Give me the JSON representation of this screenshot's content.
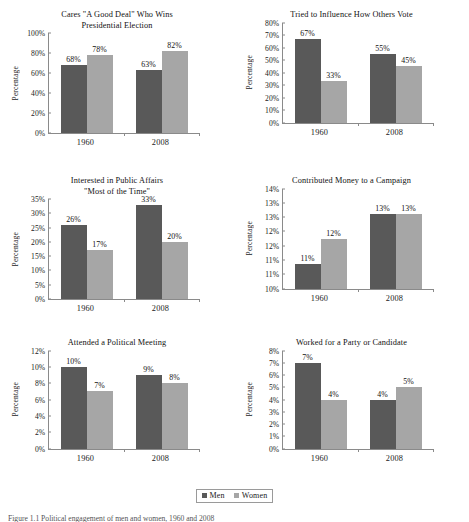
{
  "colors": {
    "men": "#595959",
    "women": "#a6a6a6",
    "axis": "#8a8a8a",
    "text": "#111111"
  },
  "legend": {
    "men_label": "Men",
    "women_label": "Women"
  },
  "caption": "Figure 1.1 Political engagement of men and women, 1960 and 2008",
  "series_names": [
    "Men",
    "Women"
  ],
  "categories": [
    "1960",
    "2008"
  ],
  "y_axis_title": "Percentage",
  "chart_data": [
    {
      "id": "cares-good-deal",
      "type": "bar",
      "title": "Cares \"A Good Deal\" Who Wins",
      "title_line2": "Presidential Election",
      "xlabel": "",
      "ylabel": "Percentage",
      "categories": [
        "1960",
        "2008"
      ],
      "series": [
        {
          "name": "Men",
          "values": [
            68,
            78
          ]
        },
        {
          "name": "Women",
          "values": [
            78,
            82
          ]
        }
      ],
      "bars": [
        {
          "category": "1960",
          "series": "Men",
          "value": 68,
          "label": "68%"
        },
        {
          "category": "1960",
          "series": "Women",
          "value": 78,
          "label": "78%"
        },
        {
          "category": "2008",
          "series": "Men",
          "value": 63,
          "label": "63%"
        },
        {
          "category": "2008",
          "series": "Women",
          "value": 82,
          "label": "82%"
        }
      ],
      "ylim": [
        0,
        100
      ],
      "yticks": [
        0,
        20,
        40,
        60,
        80,
        100
      ],
      "ytick_labels": [
        "0%",
        "20%",
        "40%",
        "60%",
        "80%",
        "100%"
      ],
      "grid": false
    },
    {
      "id": "influence-others-vote",
      "type": "bar",
      "title": "Tried to Influence How Others Vote",
      "title_line2": "",
      "xlabel": "",
      "ylabel": "Percentage",
      "categories": [
        "1960",
        "2008"
      ],
      "bars": [
        {
          "category": "1960",
          "series": "Men",
          "value": 67,
          "label": "67%"
        },
        {
          "category": "1960",
          "series": "Women",
          "value": 33,
          "label": "33%"
        },
        {
          "category": "2008",
          "series": "Men",
          "value": 55,
          "label": "55%"
        },
        {
          "category": "2008",
          "series": "Women",
          "value": 45,
          "label": "45%"
        }
      ],
      "ylim": [
        0,
        80
      ],
      "yticks": [
        0,
        10,
        20,
        30,
        40,
        50,
        60,
        70,
        80
      ],
      "ytick_labels": [
        "0%",
        "10%",
        "20%",
        "30%",
        "40%",
        "50%",
        "60%",
        "70%",
        "80%"
      ],
      "grid": false
    },
    {
      "id": "interested-public-affairs",
      "type": "bar",
      "title": "Interested in Public Affairs",
      "title_line2": "\"Most of the Time\"",
      "xlabel": "",
      "ylabel": "Percentage",
      "categories": [
        "1960",
        "2008"
      ],
      "bars": [
        {
          "category": "1960",
          "series": "Men",
          "value": 26,
          "label": "26%"
        },
        {
          "category": "1960",
          "series": "Women",
          "value": 17,
          "label": "17%"
        },
        {
          "category": "2008",
          "series": "Men",
          "value": 33,
          "label": "33%"
        },
        {
          "category": "2008",
          "series": "Women",
          "value": 20,
          "label": "20%"
        }
      ],
      "ylim": [
        0,
        35
      ],
      "yticks": [
        0,
        5,
        10,
        15,
        20,
        25,
        30,
        35
      ],
      "ytick_labels": [
        "0%",
        "5%",
        "10%",
        "15%",
        "20%",
        "25%",
        "30%",
        "35%"
      ],
      "grid": false
    },
    {
      "id": "contributed-money",
      "type": "bar",
      "title": "Contributed Money to a Campaign",
      "title_line2": "",
      "xlabel": "",
      "ylabel": "Percentage",
      "categories": [
        "1960",
        "2008"
      ],
      "bars": [
        {
          "category": "1960",
          "series": "Men",
          "value": 11,
          "label": "11%"
        },
        {
          "category": "1960",
          "series": "Women",
          "value": 12,
          "label": "12%"
        },
        {
          "category": "2008",
          "series": "Men",
          "value": 13,
          "label": "13%"
        },
        {
          "category": "2008",
          "series": "Women",
          "value": 13,
          "label": "13%"
        }
      ],
      "ylim": [
        10,
        14
      ],
      "yticks": [
        10,
        10.5,
        11,
        11.5,
        12,
        12.5,
        13,
        13.5,
        14
      ],
      "ytick_labels": [
        "10%",
        "11%",
        "11%",
        "12%",
        "12%",
        "13%",
        "13%",
        "14%"
      ],
      "grid": false
    },
    {
      "id": "attended-political-meeting",
      "type": "bar",
      "title": "Attended a Political Meeting",
      "title_line2": "",
      "xlabel": "",
      "ylabel": "Percentage",
      "categories": [
        "1960",
        "2008"
      ],
      "bars": [
        {
          "category": "1960",
          "series": "Men",
          "value": 10,
          "label": "10%"
        },
        {
          "category": "1960",
          "series": "Women",
          "value": 7,
          "label": "7%"
        },
        {
          "category": "2008",
          "series": "Men",
          "value": 9,
          "label": "9%"
        },
        {
          "category": "2008",
          "series": "Women",
          "value": 8,
          "label": "8%"
        }
      ],
      "ylim": [
        0,
        12
      ],
      "yticks": [
        0,
        2,
        4,
        6,
        8,
        10,
        12
      ],
      "ytick_labels": [
        "0%",
        "2%",
        "4%",
        "6%",
        "8%",
        "10%",
        "12%"
      ],
      "grid": false
    },
    {
      "id": "worked-for-party",
      "type": "bar",
      "title": "Worked for a Party or Candidate",
      "title_line2": "",
      "xlabel": "",
      "ylabel": "Percentage",
      "categories": [
        "1960",
        "2008"
      ],
      "bars": [
        {
          "category": "1960",
          "series": "Men",
          "value": 7,
          "label": "7%"
        },
        {
          "category": "1960",
          "series": "Women",
          "value": 4,
          "label": "4%"
        },
        {
          "category": "2008",
          "series": "Men",
          "value": 4,
          "label": "4%"
        },
        {
          "category": "2008",
          "series": "Women",
          "value": 5,
          "label": "5%"
        }
      ],
      "ylim": [
        0,
        8
      ],
      "yticks": [
        0,
        1,
        2,
        3,
        4,
        5,
        6,
        7,
        8
      ],
      "ytick_labels": [
        "0%",
        "1%",
        "2%",
        "3%",
        "4%",
        "5%",
        "6%",
        "7%",
        "8%"
      ],
      "grid": false
    }
  ]
}
